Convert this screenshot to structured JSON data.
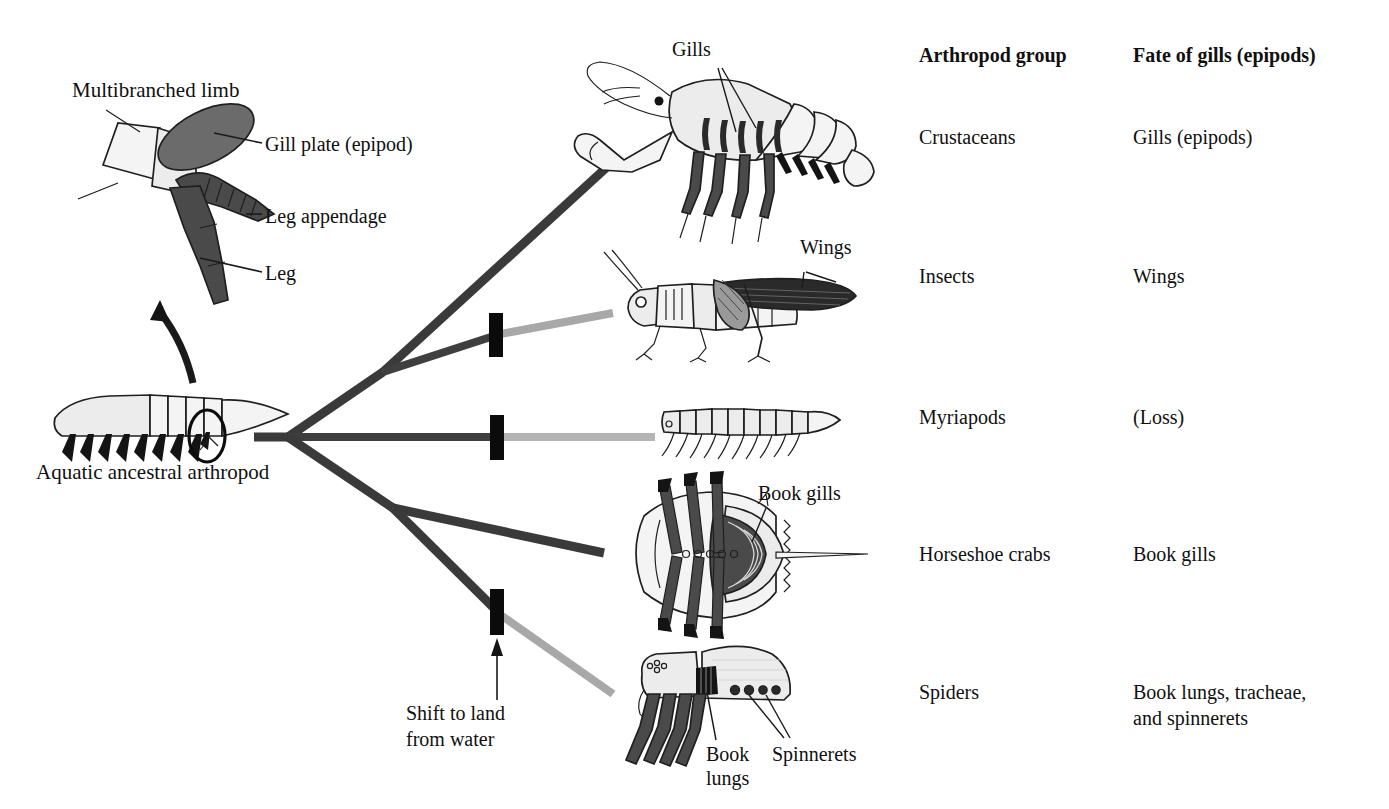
{
  "figure": {
    "type": "phylogenetic-diagram",
    "title_absent": true
  },
  "limb_panel": {
    "title": "Multibranched limb",
    "labels": [
      {
        "text": "Gill plate (epipod)",
        "part": "epipod"
      },
      {
        "text": "Leg appendage",
        "part": "exopod"
      },
      {
        "text": "Leg",
        "part": "endopod"
      }
    ]
  },
  "ancestor": {
    "caption": "Aquatic ancestral arthropod"
  },
  "annotation": {
    "shift_line1": "Shift to land",
    "shift_line2": "from water",
    "full": "Shift to land from water"
  },
  "organism_labels": {
    "crustacean": "Gills",
    "insect": "Wings",
    "horseshoe": "Book gills",
    "spider_lungs_line1": "Book",
    "spider_lungs_line2": "lungs",
    "spider_spinnerets": "Spinnerets"
  },
  "table": {
    "headers": [
      "Arthropod group",
      "Fate of gills (epipods)"
    ],
    "rows": [
      {
        "group": "Crustaceans",
        "fate": "Gills (epipods)",
        "fate_line2": ""
      },
      {
        "group": "Insects",
        "fate": "Wings",
        "fate_line2": ""
      },
      {
        "group": "Myriapods",
        "fate": "(Loss)",
        "fate_line2": ""
      },
      {
        "group": "Horseshoe crabs",
        "fate": "Book gills",
        "fate_line2": ""
      },
      {
        "group": "Spiders",
        "fate": "Book lungs, tracheae,",
        "fate_line2": "and spinnerets"
      }
    ]
  },
  "tree": {
    "terminal_order": [
      "Crustaceans",
      "Insects",
      "Myriapods",
      "Horseshoe crabs",
      "Spiders"
    ],
    "land_shift_count": 3,
    "land_shift_on": [
      "Insects",
      "Myriapods",
      "Spiders"
    ],
    "colors": {
      "aquatic_branch": "#3a3a3a",
      "terrestrial_branch": "#a8a8a8",
      "shift_bar": "#0b0b0b"
    }
  }
}
